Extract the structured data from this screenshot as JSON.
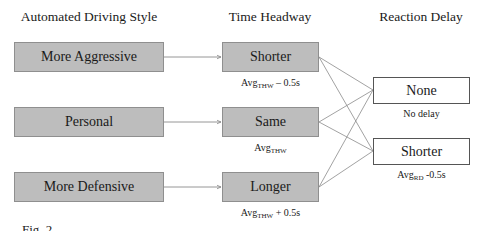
{
  "headers": {
    "style": "Automated Driving Style",
    "headway": "Time Headway",
    "delay": "Reaction Delay"
  },
  "driving_styles": [
    {
      "label": "More Aggressive"
    },
    {
      "label": "Personal"
    },
    {
      "label": "More Defensive"
    }
  ],
  "headways": [
    {
      "label": "Shorter",
      "sub_base": "Avg",
      "sub_index": "THW",
      "sub_suffix": " – 0.5s"
    },
    {
      "label": "Same",
      "sub_base": "Avg",
      "sub_index": "THW",
      "sub_suffix": ""
    },
    {
      "label": "Longer",
      "sub_base": "Avg",
      "sub_index": "THW",
      "sub_suffix": " + 0.5s"
    }
  ],
  "delays": [
    {
      "label": "None",
      "sub_text": "No delay"
    },
    {
      "label": "Shorter",
      "sub_base": "Avg",
      "sub_index": "RD",
      "sub_suffix": " -0.5s"
    }
  ],
  "caption": "Fig. 2."
}
